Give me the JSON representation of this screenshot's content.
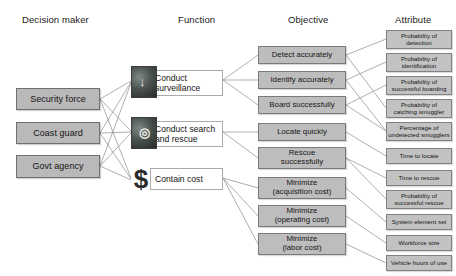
{
  "diagram": {
    "title_columns": [
      {
        "label": "Decision maker",
        "x": 22,
        "y": 14
      },
      {
        "label": "Function",
        "x": 178,
        "y": 14
      },
      {
        "label": "Objective",
        "x": 288,
        "y": 14
      },
      {
        "label": "Attribute",
        "x": 395,
        "y": 14
      }
    ],
    "decision_makers": [
      {
        "label": "Security force",
        "x": 16,
        "y": 88,
        "w": 84,
        "h": 22
      },
      {
        "label": "Coast guard",
        "x": 16,
        "y": 122,
        "w": 84,
        "h": 22
      },
      {
        "label": "Govt agency",
        "x": 16,
        "y": 155,
        "w": 84,
        "h": 23
      }
    ],
    "functions": [
      {
        "label": "Conduct surveillance",
        "line1": "Conduct",
        "line2": "surveillance",
        "icon": "surveillance-photo-icon",
        "icon_glyph": "↓",
        "x": 150,
        "y": 70,
        "w": 73,
        "h": 26,
        "icon_x": 131,
        "icon_y": 66,
        "icon_w": 24,
        "icon_h": 30
      },
      {
        "label": "Conduct search and rescue",
        "line1": "Conduct search",
        "line2": "and rescue",
        "icon": "search-rescue-photo-icon",
        "icon_glyph": "◎",
        "x": 150,
        "y": 121,
        "w": 73,
        "h": 26,
        "icon_x": 131,
        "icon_y": 117,
        "icon_w": 24,
        "icon_h": 30
      },
      {
        "label": "Contain cost",
        "line1": "Contain cost",
        "line2": "",
        "icon": "dollar-sign-icon",
        "icon_glyph": "$",
        "x": 150,
        "y": 168,
        "w": 73,
        "h": 22,
        "icon_x": 131,
        "icon_y": 163,
        "icon_w": 20,
        "icon_h": 32
      }
    ],
    "objectives": [
      {
        "line1": "Detect accurately",
        "line2": "",
        "x": 258,
        "y": 46,
        "w": 88,
        "h": 18
      },
      {
        "line1": "Identify accurately",
        "line2": "",
        "x": 258,
        "y": 71,
        "w": 88,
        "h": 18
      },
      {
        "line1": "Board successfully",
        "line2": "",
        "x": 258,
        "y": 96,
        "w": 88,
        "h": 18
      },
      {
        "line1": "Locate quickly",
        "line2": "",
        "x": 258,
        "y": 123,
        "w": 88,
        "h": 18
      },
      {
        "line1": "Rescue",
        "line2": "successfully",
        "x": 258,
        "y": 147,
        "w": 88,
        "h": 22
      },
      {
        "line1": "Minimize",
        "line2": "(acquisition cost)",
        "x": 258,
        "y": 177,
        "w": 88,
        "h": 22
      },
      {
        "line1": "Minimize",
        "line2": "(operating cost)",
        "x": 258,
        "y": 205,
        "w": 88,
        "h": 22
      },
      {
        "line1": "Minimize",
        "line2": "(labor cost)",
        "x": 258,
        "y": 233,
        "w": 88,
        "h": 22
      }
    ],
    "attributes": [
      {
        "line1": "Probability of",
        "line2": "detection",
        "x": 386,
        "y": 30,
        "w": 66,
        "h": 19
      },
      {
        "line1": "Probability of",
        "line2": "identification",
        "x": 386,
        "y": 53,
        "w": 66,
        "h": 19
      },
      {
        "line1": "Probability of",
        "line2": "successful boarding",
        "x": 386,
        "y": 76,
        "w": 66,
        "h": 19
      },
      {
        "line1": "Probability of",
        "line2": "catching smuggler",
        "x": 386,
        "y": 99,
        "w": 66,
        "h": 19
      },
      {
        "line1": "Percentage of",
        "line2": "undetected smugglers",
        "x": 386,
        "y": 122,
        "w": 66,
        "h": 19
      },
      {
        "line1": "Time to locate",
        "line2": "",
        "x": 386,
        "y": 148,
        "w": 66,
        "h": 16
      },
      {
        "line1": "Time to rescue",
        "line2": "",
        "x": 386,
        "y": 170,
        "w": 66,
        "h": 16
      },
      {
        "line1": "Probability of",
        "line2": "successful rescue",
        "x": 386,
        "y": 190,
        "w": 66,
        "h": 19
      },
      {
        "line1": "System element set",
        "line2": "",
        "x": 386,
        "y": 214,
        "w": 66,
        "h": 16
      },
      {
        "line1": "Workforce size",
        "line2": "",
        "x": 386,
        "y": 235,
        "w": 66,
        "h": 16
      },
      {
        "line1": "Vehicle hours of use",
        "line2": "",
        "x": 386,
        "y": 255,
        "w": 66,
        "h": 16
      }
    ],
    "links_dm_function": [
      {
        "from": [
          100,
          99
        ],
        "to": [
          131,
          81
        ]
      },
      {
        "from": [
          100,
          99
        ],
        "to": [
          131,
          131
        ]
      },
      {
        "from": [
          100,
          99
        ],
        "to": [
          131,
          178
        ]
      },
      {
        "from": [
          100,
          133
        ],
        "to": [
          131,
          82
        ]
      },
      {
        "from": [
          100,
          133
        ],
        "to": [
          131,
          132
        ]
      },
      {
        "from": [
          100,
          133
        ],
        "to": [
          131,
          179
        ]
      },
      {
        "from": [
          100,
          166
        ],
        "to": [
          131,
          83
        ]
      },
      {
        "from": [
          100,
          166
        ],
        "to": [
          131,
          133
        ]
      },
      {
        "from": [
          100,
          166
        ],
        "to": [
          131,
          180
        ]
      }
    ],
    "links_function_objective": [
      {
        "from": [
          223,
          80
        ],
        "to": [
          258,
          55
        ]
      },
      {
        "from": [
          223,
          80
        ],
        "to": [
          258,
          80
        ]
      },
      {
        "from": [
          223,
          80
        ],
        "to": [
          258,
          105
        ]
      },
      {
        "from": [
          223,
          132
        ],
        "to": [
          258,
          132
        ]
      },
      {
        "from": [
          223,
          132
        ],
        "to": [
          258,
          158
        ]
      },
      {
        "from": [
          223,
          178
        ],
        "to": [
          258,
          188
        ]
      },
      {
        "from": [
          223,
          178
        ],
        "to": [
          258,
          216
        ]
      },
      {
        "from": [
          223,
          178
        ],
        "to": [
          258,
          244
        ]
      }
    ],
    "links_objective_attribute": [
      {
        "from": [
          346,
          55
        ],
        "to": [
          386,
          39
        ]
      },
      {
        "from": [
          346,
          55
        ],
        "to": [
          386,
          108
        ]
      },
      {
        "from": [
          346,
          80
        ],
        "to": [
          386,
          62
        ]
      },
      {
        "from": [
          346,
          80
        ],
        "to": [
          386,
          131
        ]
      },
      {
        "from": [
          346,
          105
        ],
        "to": [
          386,
          85
        ]
      },
      {
        "from": [
          346,
          105
        ],
        "to": [
          386,
          131
        ]
      },
      {
        "from": [
          346,
          132
        ],
        "to": [
          386,
          156
        ]
      },
      {
        "from": [
          346,
          158
        ],
        "to": [
          386,
          178
        ]
      },
      {
        "from": [
          346,
          158
        ],
        "to": [
          386,
          199
        ]
      },
      {
        "from": [
          346,
          188
        ],
        "to": [
          386,
          222
        ]
      },
      {
        "from": [
          346,
          216
        ],
        "to": [
          386,
          243
        ]
      },
      {
        "from": [
          346,
          244
        ],
        "to": [
          386,
          263
        ]
      }
    ],
    "colors": {
      "box_gray": "#bdbdbd",
      "box_border": "#7a7a7a",
      "line": "#8d8d8d",
      "text": "#151515",
      "background": "#ffffff"
    }
  }
}
